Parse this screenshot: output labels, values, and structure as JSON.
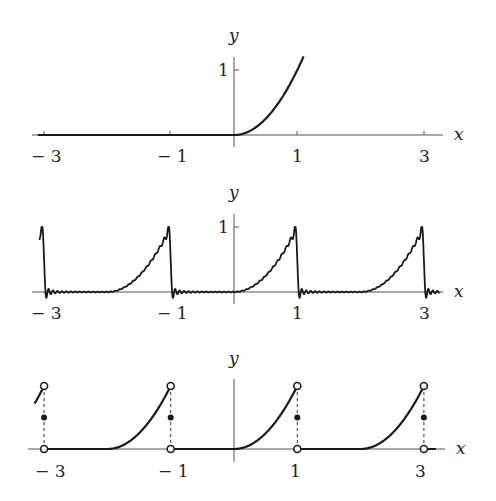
{
  "chart_data": [
    {
      "type": "line",
      "title": "",
      "description": "Function f(x) = 0 for x<0, x^2 for x>=0",
      "xlabel": "x",
      "ylabel": "y",
      "xticks": [
        "-3",
        "-1",
        "1",
        "3"
      ],
      "yticks": [
        "1"
      ],
      "xlim": [
        -3.1,
        3.3
      ],
      "ylim": [
        0,
        1.25
      ],
      "grid": false,
      "series": [
        {
          "name": "f(x)",
          "x": [
            -3.1,
            -1,
            0,
            0.25,
            0.5,
            0.75,
            1,
            1.1
          ],
          "y": [
            0,
            0,
            0,
            0.0625,
            0.25,
            0.5625,
            1,
            1.21
          ]
        }
      ]
    },
    {
      "type": "line",
      "title": "",
      "description": "Fourier partial sum of the 2-periodic extension, showing Gibbs oscillations near jumps",
      "xlabel": "x",
      "ylabel": "y",
      "xticks": [
        "-3",
        "-1",
        "1",
        "3"
      ],
      "yticks": [
        "1"
      ],
      "xlim": [
        -3.1,
        3.3
      ],
      "ylim": [
        -0.1,
        1.05
      ],
      "grid": false,
      "series": [
        {
          "name": "S_N(x)",
          "period": 2,
          "peak_height": 1.0,
          "overshoot_min": -0.08
        }
      ]
    },
    {
      "type": "line",
      "title": "",
      "description": "2-periodic extension with jump discontinuities at odd integers; open circles at y=0 and y=1, filled dots at midpoint y=0.5",
      "xlabel": "x",
      "ylabel": "y",
      "xticks": [
        "-3",
        "-1",
        "1",
        "3"
      ],
      "yticks": [],
      "xlim": [
        -3.1,
        3.3
      ],
      "ylim": [
        0,
        1.05
      ],
      "grid": false,
      "series": [
        {
          "name": "periodic extension",
          "period": 2
        },
        {
          "name": "open circles",
          "x": [
            -3,
            -1,
            1,
            3,
            -3,
            -1,
            1,
            3
          ],
          "y": [
            0,
            0,
            0,
            0,
            1,
            1,
            1,
            1
          ]
        },
        {
          "name": "midpoint values",
          "x": [
            -3,
            -1,
            1,
            3
          ],
          "y": [
            0.5,
            0.5,
            0.5,
            0.5
          ]
        }
      ]
    }
  ],
  "panels": [
    {
      "x_label": "x",
      "y_label": "y",
      "ytick": "1",
      "xticks": [
        "− 3",
        "− 1",
        "1",
        "3"
      ]
    },
    {
      "x_label": "x",
      "y_label": "y",
      "ytick": "1",
      "xticks": [
        "− 3",
        "− 1",
        "1",
        "3"
      ]
    },
    {
      "x_label": "x",
      "y_label": "y",
      "xticks": [
        "− 3",
        "− 1",
        "1",
        "3"
      ]
    }
  ]
}
